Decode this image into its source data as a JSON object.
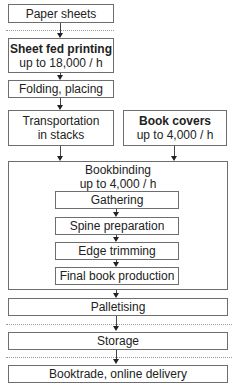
{
  "diagram": {
    "nodes": {
      "paper_sheets": {
        "label": "Paper sheets"
      },
      "sheet_fed_printing": {
        "label": "Sheet fed printing",
        "rate": "up to 18,000 / h"
      },
      "folding_placing": {
        "label": "Folding, placing"
      },
      "transportation": {
        "line1": "Transportation",
        "line2": "in stacks"
      },
      "book_covers": {
        "label": "Book covers",
        "rate": "up to 4,000 / h"
      },
      "bookbinding": {
        "label": "Bookbinding",
        "rate": "up to 4,000 / h",
        "steps": [
          {
            "label": "Gathering"
          },
          {
            "label": "Spine preparation"
          },
          {
            "label": "Edge trimming"
          },
          {
            "label": "Final book production"
          }
        ]
      },
      "palletising": {
        "label": "Palletising"
      },
      "storage": {
        "label": "Storage"
      },
      "booktrade": {
        "label": "Booktrade, online delivery"
      }
    },
    "edges": [
      [
        "paper_sheets",
        "sheet_fed_printing"
      ],
      [
        "sheet_fed_printing",
        "folding_placing"
      ],
      [
        "folding_placing",
        "transportation"
      ],
      [
        "transportation",
        "bookbinding"
      ],
      [
        "book_covers",
        "bookbinding"
      ],
      [
        "gathering",
        "spine_preparation"
      ],
      [
        "spine_preparation",
        "edge_trimming"
      ],
      [
        "edge_trimming",
        "final_book_production"
      ],
      [
        "bookbinding",
        "palletising"
      ],
      [
        "palletising",
        "storage"
      ],
      [
        "storage",
        "booktrade"
      ]
    ]
  }
}
